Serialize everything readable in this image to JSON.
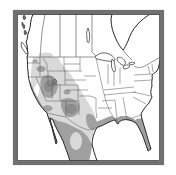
{
  "map": {
    "description": "north-america-species-range-map",
    "background": "#ffffff",
    "land_color": "#ffffff",
    "frame_color": "#707070",
    "frame_inner_line_color": "#3f3f3f",
    "outline_color": "#262626",
    "state_boundary_color": "#5a5a5a",
    "shades": {
      "light": "#d9d9d9",
      "medium": "#a0a0a0",
      "dark": "#8b8b8b"
    },
    "regions": [
      {
        "name": "interior-west-and-plains",
        "shade": "light"
      },
      {
        "name": "alberta-fringe",
        "shade": "light"
      },
      {
        "name": "washington-spot",
        "shade": "medium"
      },
      {
        "name": "oregon-idaho-spot",
        "shade": "medium"
      },
      {
        "name": "great-basin",
        "shade": "medium"
      },
      {
        "name": "great-basin-core",
        "shade": "dark"
      },
      {
        "name": "california-coast-and-sierra",
        "shade": "medium"
      },
      {
        "name": "central-valley-gap",
        "shade": "none"
      },
      {
        "name": "southern-california",
        "shade": "medium"
      },
      {
        "name": "baja-california",
        "shade": "medium"
      },
      {
        "name": "colorado-spot",
        "shade": "medium"
      },
      {
        "name": "west-texas-new-mexico",
        "shade": "medium"
      },
      {
        "name": "west-texas-core",
        "shade": "dark"
      },
      {
        "name": "south-texas-tamaulipas",
        "shade": "medium"
      },
      {
        "name": "mexico-mainland",
        "shade": "medium"
      },
      {
        "name": "mexico-interior-light-patch",
        "shade": "light"
      },
      {
        "name": "gulf-coast-band",
        "shade": "medium"
      },
      {
        "name": "mississippi-delta-spot",
        "shade": "dark"
      },
      {
        "name": "florida-peninsula",
        "shade": "medium"
      }
    ]
  }
}
